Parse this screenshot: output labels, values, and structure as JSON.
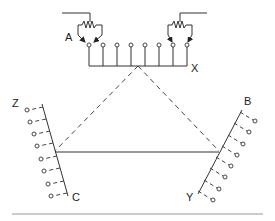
{
  "diagram": {
    "title": "",
    "labels": {
      "A": "A",
      "X": "X",
      "Z": "Z",
      "B": "B",
      "C": "C",
      "Y": "Y"
    },
    "top_switch_bank": {
      "terminal_count": 8,
      "contacts": [
        "A",
        "X"
      ],
      "wipers": [
        {
          "name": "left-rheostat",
          "targets": [
            1,
            2
          ]
        },
        {
          "name": "right-rheostat",
          "targets": [
            7,
            8
          ]
        }
      ]
    },
    "left_bank": {
      "end_labels": [
        "Z",
        "C"
      ],
      "terminal_count": 8
    },
    "right_bank": {
      "end_labels": [
        "B",
        "Y"
      ],
      "terminal_count": 8
    },
    "connections": [
      {
        "from": "X-bus center",
        "to": "Z-C rail",
        "style": "dashed"
      },
      {
        "from": "X-bus center",
        "to": "B-Y rail",
        "style": "dashed"
      },
      {
        "from": "Z-C rail",
        "to": "B-Y rail",
        "style": "solid"
      }
    ],
    "colors": {
      "line": "#333333",
      "baseline": "#bbbbbb",
      "background": "#ffffff"
    }
  }
}
